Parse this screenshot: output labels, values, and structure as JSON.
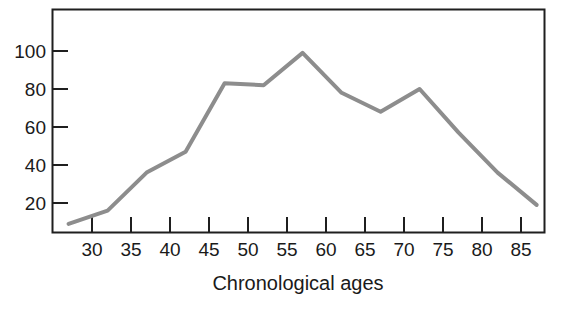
{
  "chart_data": {
    "type": "line",
    "title": "",
    "subtitle": "",
    "xlabel": "Chronological ages",
    "ylabel": "",
    "x": [
      27,
      32,
      37,
      42,
      47,
      52,
      57,
      62,
      67,
      72,
      77,
      82,
      87
    ],
    "values": [
      9,
      16,
      36,
      47,
      83,
      82,
      99,
      78,
      68,
      80,
      57,
      36,
      19
    ],
    "series": [
      {
        "name": "",
        "values": [
          9,
          16,
          36,
          47,
          83,
          82,
          99,
          78,
          68,
          80,
          57,
          36,
          19
        ]
      }
    ],
    "xticks": [
      30,
      35,
      40,
      45,
      50,
      55,
      60,
      65,
      70,
      75,
      80,
      85
    ],
    "xtick_labels": [
      "30",
      "35",
      "40",
      "45",
      "50",
      "55",
      "60",
      "65",
      "70",
      "75",
      "80",
      "85"
    ],
    "yticks": [
      20,
      40,
      60,
      80,
      100
    ],
    "ytick_labels": [
      "20",
      "40",
      "60",
      "80",
      "100"
    ],
    "xlim": [
      25.5,
      89.0
    ],
    "ylim": [
      0,
      118
    ],
    "grid": false,
    "legend": null,
    "legend_position": "none",
    "annotations": [],
    "colors": {
      "line": "#8d8d8d",
      "line_highlight": "#b9b9b9",
      "axis": "#1f1f1f",
      "text": "#1a1a1a",
      "background": "#ffffff"
    },
    "line_width": 4
  }
}
